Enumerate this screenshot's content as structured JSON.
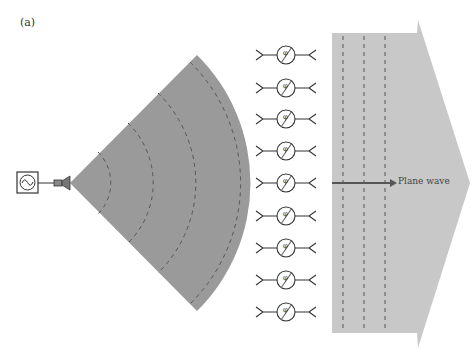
{
  "figure": {
    "panel_label": "(a)",
    "plane_wave_label": "Plane wave",
    "phase_symbol": "φ",
    "colors": {
      "sector_fill": "#9a9a9a",
      "plane_fill": "#c8c8c8",
      "dash_stroke": "#555555",
      "line_stroke": "#333333",
      "arrow_stroke": "#555555"
    },
    "elements": {
      "source": "signal-source",
      "feed": "horn-antenna",
      "phase_shifter_count": 9
    }
  }
}
